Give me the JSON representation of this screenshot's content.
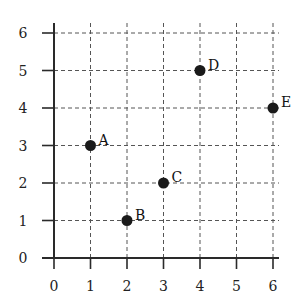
{
  "chart_data": {
    "type": "scatter",
    "title": "",
    "xlabel": "",
    "ylabel": "",
    "xlim": [
      0,
      6
    ],
    "ylim": [
      0,
      6
    ],
    "grid": true,
    "grid_style": "dashed",
    "x_ticks": [
      "0",
      "1",
      "2",
      "3",
      "4",
      "5",
      "6"
    ],
    "y_ticks": [
      "0",
      "1",
      "2",
      "3",
      "4",
      "5",
      "6"
    ],
    "points": [
      {
        "label": "A",
        "x": 1,
        "y": 3
      },
      {
        "label": "B",
        "x": 2,
        "y": 1
      },
      {
        "label": "C",
        "x": 3,
        "y": 2
      },
      {
        "label": "D",
        "x": 4,
        "y": 5
      },
      {
        "label": "E",
        "x": 6,
        "y": 4
      }
    ],
    "colors": {
      "point": "#1a1a1a",
      "axis": "#2a2a2a",
      "grid": "#555555"
    }
  },
  "labels": {
    "xt": [
      "0",
      "1",
      "2",
      "3",
      "4",
      "5",
      "6"
    ],
    "yt": [
      "0",
      "1",
      "2",
      "3",
      "4",
      "5",
      "6"
    ],
    "pts": [
      "A",
      "B",
      "C",
      "D",
      "E"
    ]
  }
}
